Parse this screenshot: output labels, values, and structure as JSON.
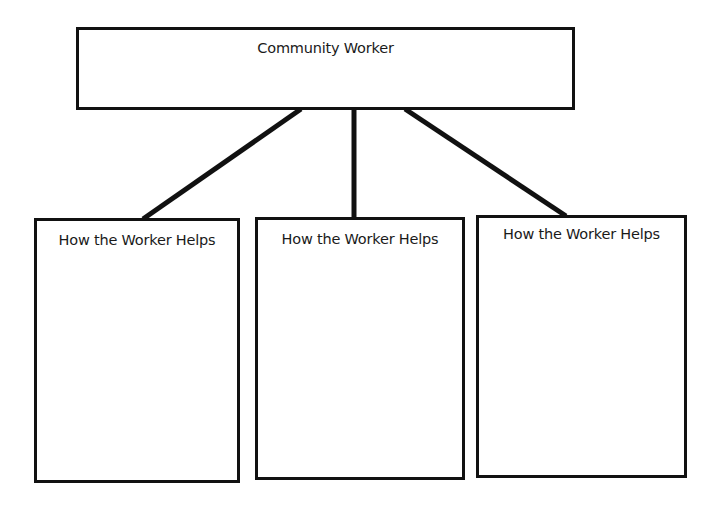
{
  "diagram": {
    "type": "graphic-organizer",
    "root": {
      "label": "Community Worker"
    },
    "children": [
      {
        "label": "How the Worker Helps"
      },
      {
        "label": "How the Worker Helps"
      },
      {
        "label": "How the Worker Helps"
      }
    ],
    "colors": {
      "stroke": "#111111",
      "background": "#ffffff",
      "text": "#1a1a1a"
    }
  }
}
